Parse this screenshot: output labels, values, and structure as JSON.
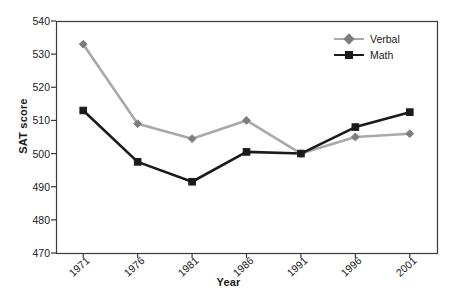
{
  "chart_data": {
    "type": "line",
    "title": "",
    "xlabel": "Year",
    "ylabel": "SAT score",
    "categories": [
      "1971",
      "1976",
      "1981",
      "1986",
      "1991",
      "1996",
      "2001"
    ],
    "x": [
      1971,
      1976,
      1981,
      1986,
      1991,
      1996,
      2001
    ],
    "series": [
      {
        "name": "Verbal",
        "color": "#a9a9a9",
        "marker": "diamond",
        "values": [
          533,
          509,
          504.5,
          510,
          500,
          505,
          506
        ]
      },
      {
        "name": "Math",
        "color": "#1a1a1a",
        "marker": "square",
        "values": [
          513,
          497.5,
          491.5,
          500.5,
          500,
          508,
          512.5
        ]
      }
    ],
    "ylim": [
      470,
      540
    ],
    "yticks": [
      470,
      480,
      490,
      500,
      510,
      520,
      530,
      540
    ],
    "ytick_labels": [
      "470",
      "480",
      "490",
      "500",
      "510",
      "520",
      "530",
      "540"
    ],
    "grid": false,
    "legend_position": "top-right",
    "frame": {
      "left": 56,
      "right": 437,
      "top": 21,
      "bottom": 253
    }
  },
  "legend": {
    "entries": [
      {
        "label": "Verbal"
      },
      {
        "label": "Math"
      }
    ]
  }
}
